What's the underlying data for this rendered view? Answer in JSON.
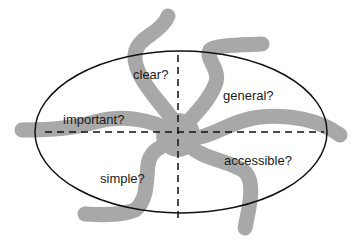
{
  "diagram": {
    "type": "concept-ellipse-with-quadrants",
    "colors": {
      "background": "#ffffff",
      "ellipse_stroke": "#111111",
      "axis_stroke": "#111111",
      "blob_fill": "#a8a8a8",
      "label_text": "#1a1a1a"
    },
    "labels": {
      "clear": "clear?",
      "general": "general?",
      "important": "important?",
      "accessible": "accessible?",
      "simple": "simple?"
    }
  }
}
